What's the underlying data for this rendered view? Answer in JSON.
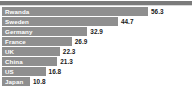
{
  "chart_data": {
    "type": "bar",
    "orientation": "horizontal",
    "title": "",
    "subtitle": "",
    "xlabel": "",
    "ylabel": "",
    "grid": false,
    "legend": null,
    "xlim": [
      0,
      56.3
    ],
    "categories": [
      "Rwanda",
      "Sweden",
      "Germany",
      "France",
      "UK",
      "China",
      "US",
      "Japan"
    ],
    "values": [
      56.3,
      44.7,
      32.9,
      26.9,
      22.3,
      21.3,
      16.8,
      10.8
    ],
    "bars": [
      {
        "label": "Rwanda",
        "value": 56.3,
        "value_text": "56.3"
      },
      {
        "label": "Sweden",
        "value": 44.7,
        "value_text": "44.7"
      },
      {
        "label": "Germany",
        "value": 32.9,
        "value_text": "32.9"
      },
      {
        "label": "France",
        "value": 26.9,
        "value_text": "26.9"
      },
      {
        "label": "UK",
        "value": 22.3,
        "value_text": "22.3"
      },
      {
        "label": "China",
        "value": 21.3,
        "value_text": "21.3"
      },
      {
        "label": "US",
        "value": 16.8,
        "value_text": "16.8"
      },
      {
        "label": "Japan",
        "value": 10.8,
        "value_text": "10.8"
      }
    ]
  },
  "style": {
    "bar_color": "#8f8f8f",
    "bar_label_color": "#ffffff",
    "value_label_color": "#1a1a1a",
    "top_rule_color": "#7b7b7b",
    "background": "#ffffff"
  }
}
